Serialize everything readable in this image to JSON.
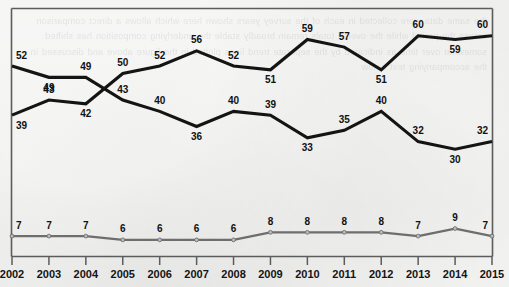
{
  "chart_data": {
    "type": "line",
    "title": "",
    "subtitle": "",
    "xlabel": "",
    "ylabel": "",
    "x": [
      "2002",
      "2003",
      "2004",
      "2005",
      "2006",
      "2007",
      "2008",
      "2009",
      "2010",
      "2011",
      "2012",
      "2013",
      "2014",
      "2015"
    ],
    "categories": [
      "2002",
      "2003",
      "2004",
      "2005",
      "2006",
      "2007",
      "2008",
      "2009",
      "2010",
      "2011",
      "2012",
      "2013",
      "2014",
      "2015"
    ],
    "grid": false,
    "legend_position": "none",
    "ylim": [
      0,
      66
    ],
    "series": [
      {
        "name": "series-upper",
        "color": "#141414",
        "style": "thick-dark",
        "values": [
          52,
          49,
          49,
          43,
          40,
          36,
          40,
          39,
          33,
          35,
          40,
          32,
          30,
          32
        ],
        "labels": [
          "52",
          "49",
          "49",
          "43",
          "40",
          "36",
          "40",
          "39",
          "33",
          "35",
          "40",
          "32",
          "30",
          "32"
        ]
      },
      {
        "name": "series-lower",
        "color": "#141414",
        "style": "thick-dark",
        "values": [
          39,
          43,
          42,
          50,
          52,
          56,
          52,
          51,
          59,
          57,
          51,
          60,
          59,
          60
        ],
        "labels": [
          "39",
          "43",
          "42",
          "50",
          "52",
          "56",
          "52",
          "51",
          "59",
          "57",
          "51",
          "60",
          "59",
          "60"
        ]
      },
      {
        "name": "series-bottom",
        "color": "#6e6e6e",
        "style": "thin-gray-markers",
        "values": [
          7,
          7,
          7,
          6,
          6,
          6,
          6,
          8,
          8,
          8,
          8,
          7,
          9,
          7
        ],
        "labels": [
          "7",
          "7",
          "7",
          "6",
          "6",
          "6",
          "6",
          "8",
          "8",
          "8",
          "8",
          "7",
          "9",
          "7"
        ]
      }
    ]
  },
  "axis": {
    "tick_labels": [
      "2002",
      "2003",
      "2004",
      "2005",
      "2006",
      "2007",
      "2008",
      "2009",
      "2010",
      "2011",
      "2012",
      "2013",
      "2014",
      "2015"
    ]
  },
  "background": {
    "bleed_text": "the same data were collected in each of the survey years shown here which allows a direct comparison across the period while the overall totals remain broadly stable the underlying composition has shifted somewhat over time as indicated by the separate trend lines plotted in the figure above and discussed in the accompanying text below"
  }
}
